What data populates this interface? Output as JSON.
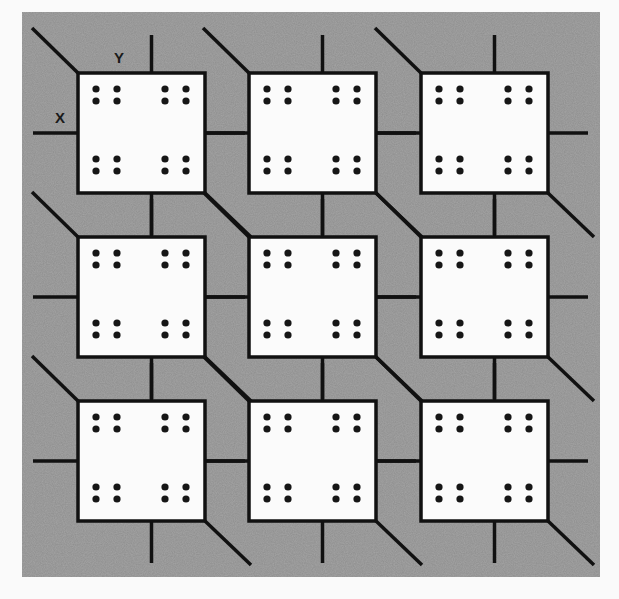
{
  "diagram": {
    "axis_labels": {
      "x": "X",
      "y": "Y"
    },
    "colors": {
      "background": "#fafafa",
      "substrate": "#8e8e8e",
      "cell_fill": "#fbfbfb",
      "line": "#111111",
      "dot": "#161616"
    },
    "grid": {
      "rows": 3,
      "cols": 3
    },
    "cells": [
      {
        "row": 0,
        "col": 0
      },
      {
        "row": 0,
        "col": 1
      },
      {
        "row": 0,
        "col": 2
      },
      {
        "row": 1,
        "col": 0
      },
      {
        "row": 1,
        "col": 1
      },
      {
        "row": 1,
        "col": 2
      },
      {
        "row": 2,
        "col": 0
      },
      {
        "row": 2,
        "col": 1
      },
      {
        "row": 2,
        "col": 2
      }
    ],
    "dots_per_corner_group": 4,
    "corner_groups_per_cell": 4
  }
}
